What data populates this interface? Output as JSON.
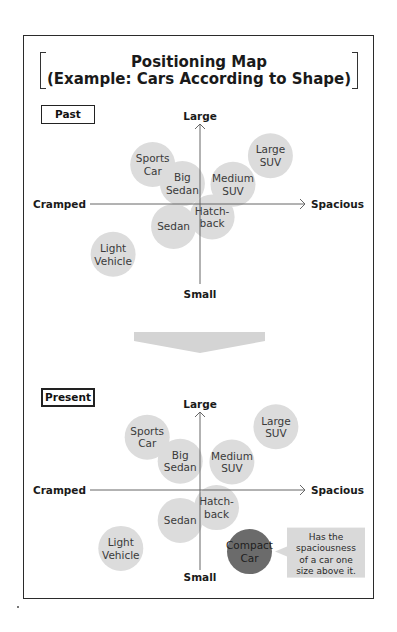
{
  "title": {
    "line1": "Positioning Map",
    "line2": "(Example: Cars According to Shape)"
  },
  "axes": {
    "top": "Large",
    "bottom": "Small",
    "left": "Cramped",
    "right": "Spacious"
  },
  "colors": {
    "circle_fill": "#dcdcdc",
    "circle_text": "#3a3a3a",
    "highlight_fill": "#6b6b6b",
    "highlight_text": "#1e1e1e",
    "callout_fill": "#d9d9d9",
    "axis_line": "#666666",
    "transition_arrow": "#d4d4d4"
  },
  "panels": [
    {
      "label": "Past",
      "items": [
        {
          "name": "Sports Car",
          "lines": [
            "Sports",
            "Car"
          ],
          "x": -0.43,
          "y": 0.58,
          "highlight": false
        },
        {
          "name": "Big Sedan",
          "lines": [
            "Big",
            "Sedan"
          ],
          "x": -0.16,
          "y": 0.3,
          "highlight": false
        },
        {
          "name": "Medium SUV",
          "lines": [
            "Medium",
            "SUV"
          ],
          "x": 0.3,
          "y": 0.29,
          "highlight": false
        },
        {
          "name": "Large SUV",
          "lines": [
            "Large",
            "SUV"
          ],
          "x": 0.64,
          "y": 0.71,
          "highlight": false
        },
        {
          "name": "Hatchback",
          "lines": [
            "Hatch-",
            "back"
          ],
          "x": 0.11,
          "y": -0.19,
          "highlight": false
        },
        {
          "name": "Sedan",
          "lines": [
            "Sedan"
          ],
          "x": -0.24,
          "y": -0.33,
          "highlight": false
        },
        {
          "name": "Light Vehicle",
          "lines": [
            "Light",
            "Vehicle"
          ],
          "x": -0.79,
          "y": -0.74,
          "highlight": false
        }
      ]
    },
    {
      "label": "Present",
      "items": [
        {
          "name": "Sports Car",
          "lines": [
            "Sports",
            "Car"
          ],
          "x": -0.48,
          "y": 0.66,
          "highlight": false
        },
        {
          "name": "Big Sedan",
          "lines": [
            "Big",
            "Sedan"
          ],
          "x": -0.18,
          "y": 0.36,
          "highlight": false
        },
        {
          "name": "Medium SUV",
          "lines": [
            "Medium",
            "SUV"
          ],
          "x": 0.29,
          "y": 0.35,
          "highlight": false
        },
        {
          "name": "Large SUV",
          "lines": [
            "Large",
            "SUV"
          ],
          "x": 0.69,
          "y": 0.79,
          "highlight": false
        },
        {
          "name": "Hatchback",
          "lines": [
            "Hatch-",
            "back"
          ],
          "x": 0.15,
          "y": -0.22,
          "highlight": false
        },
        {
          "name": "Sedan",
          "lines": [
            "Sedan"
          ],
          "x": -0.18,
          "y": -0.38,
          "highlight": false
        },
        {
          "name": "Light Vehicle",
          "lines": [
            "Light",
            "Vehicle"
          ],
          "x": -0.72,
          "y": -0.73,
          "highlight": false
        },
        {
          "name": "Compact Car",
          "lines": [
            "Compact",
            "Car"
          ],
          "x": 0.45,
          "y": -0.77,
          "highlight": true
        }
      ],
      "callout": {
        "target": "Compact Car",
        "lines": [
          "Has the",
          "spaciousness",
          "of a car one",
          "size above it."
        ]
      }
    }
  ]
}
